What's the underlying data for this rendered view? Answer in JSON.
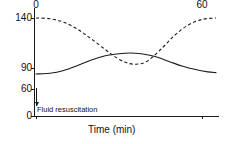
{
  "chart_data": {
    "type": "line",
    "title": "",
    "subtitle": "",
    "xlabel": "Time (min)",
    "ylabel": "",
    "xlim": [
      0,
      65
    ],
    "ylim": [
      0,
      150
    ],
    "xticks": [
      0,
      60
    ],
    "xticklabels": [
      "0",
      "60"
    ],
    "yticks": [
      0,
      60,
      90,
      140
    ],
    "yticklabels": [
      "0",
      "60",
      "90",
      "140"
    ],
    "grid": false,
    "legend": "none",
    "annotations": [
      {
        "text": "Fluid resuscitation",
        "x": 0,
        "y": 0,
        "marker": "up-arrow"
      }
    ],
    "series": [
      {
        "name": "heart-rate",
        "style": "dashed",
        "color": "#1a1a1a",
        "x": [
          0,
          5,
          10,
          15,
          20,
          25,
          28,
          32,
          36,
          40,
          45,
          50,
          55,
          60,
          65
        ],
        "y": [
          140,
          139,
          134,
          124,
          110,
          95,
          86,
          77,
          74,
          78,
          95,
          115,
          130,
          138,
          140
        ]
      },
      {
        "name": "blood-pressure",
        "style": "solid",
        "color": "#1a1a1a",
        "x": [
          0,
          5,
          10,
          15,
          20,
          25,
          30,
          34,
          38,
          43,
          48,
          53,
          58,
          62,
          65
        ],
        "y": [
          60,
          61,
          65,
          72,
          80,
          86,
          89,
          90,
          89,
          85,
          78,
          71,
          66,
          63,
          62
        ]
      }
    ]
  },
  "axes": {
    "ytick_labels": [
      "140",
      "90",
      "60",
      "0"
    ],
    "xtick_labels": [
      "0",
      "60"
    ],
    "x_axis_title": "Time (min)"
  },
  "annotation": {
    "label": "Fluid resuscitation"
  }
}
